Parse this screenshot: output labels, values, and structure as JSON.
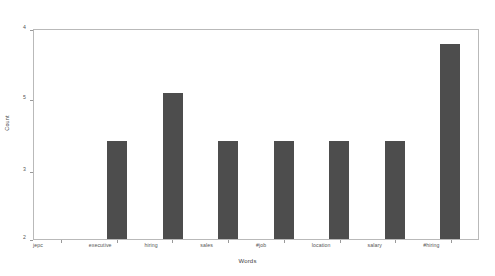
{
  "chart_data": {
    "type": "bar",
    "title": "",
    "xlabel": "Words",
    "ylabel": "Count",
    "categories": [
      "jepc",
      "executive",
      "hiring",
      "sales",
      "#job",
      "location",
      "salary",
      "#hiring"
    ],
    "values": [
      2,
      3,
      3.5,
      3,
      3,
      3,
      3,
      4
    ],
    "ytick_labels": [
      "4",
      "5",
      "3",
      "2"
    ],
    "ytick_values": [
      4,
      3.5,
      3,
      2
    ],
    "ylim": [
      2,
      4.15
    ],
    "grid": false,
    "legend": null,
    "bar_color": "#4d4d4d",
    "axis_color": "#b9b9b9",
    "background": "#ffffff"
  }
}
